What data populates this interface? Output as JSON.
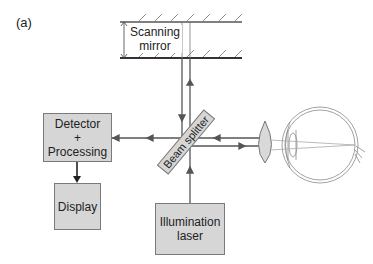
{
  "figure": {
    "panel_label": "(a)",
    "mirror_label_line1": "Scanning",
    "mirror_label_line2": "mirror",
    "detector_line1": "Detector",
    "detector_line2": "+",
    "detector_line3": "Processing",
    "display_label": "Display",
    "laser_line1": "Illumination",
    "laser_line2": "laser",
    "beam_splitter_label": "Beam splitter"
  },
  "colors": {
    "line": "#555555",
    "box_fill": "#d6d6d6",
    "box_border": "#7a7a7a",
    "lens_fill": "#d9d9d9",
    "eye_stroke": "#8a8a8a"
  }
}
